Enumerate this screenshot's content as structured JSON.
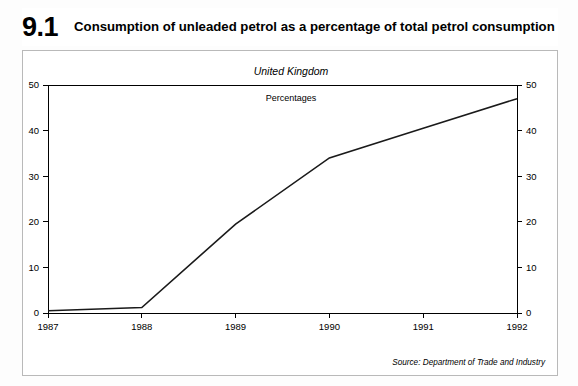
{
  "header": {
    "number": "9.1",
    "title": "Consumption of unleaded petrol as a percentage of total petrol consumption"
  },
  "chart_box": {
    "region": "United Kingdom",
    "units": "Percentages",
    "source": "Source: Department of Trade and Industry"
  },
  "chart_data": {
    "type": "line",
    "title": "Consumption of unleaded petrol as a percentage of total petrol consumption",
    "subtitle": "United Kingdom",
    "xlabel": "",
    "ylabel": "Percentages",
    "x": [
      1987,
      1988,
      1989,
      1990,
      1991,
      1992
    ],
    "categories": [
      "1987",
      "1988",
      "1989",
      "1990",
      "1991",
      "1992"
    ],
    "values": [
      0.5,
      1.2,
      19.5,
      34.0,
      40.5,
      47.0
    ],
    "series": [
      {
        "name": "Unleaded petrol share of total petrol consumption",
        "values": [
          0.5,
          1.2,
          19.5,
          34.0,
          40.5,
          47.0
        ]
      }
    ],
    "ylim": [
      0,
      50
    ],
    "xlim": [
      1987,
      1992
    ],
    "yticks": [
      0,
      10,
      20,
      30,
      40,
      50
    ],
    "ytick_labels": [
      "0",
      "10",
      "20",
      "30",
      "40",
      "50"
    ],
    "xticks": [
      1987,
      1988,
      1989,
      1990,
      1991,
      1992
    ],
    "xtick_labels": [
      "1987",
      "1988",
      "1989",
      "1990",
      "1991",
      "1992"
    ],
    "right_axis_labels": [
      "0",
      "10",
      "20",
      "30",
      "40",
      "50"
    ],
    "grid": false,
    "legend": false,
    "line_color": "#1a1a1a",
    "source": "Source: Department of Trade and Industry"
  }
}
